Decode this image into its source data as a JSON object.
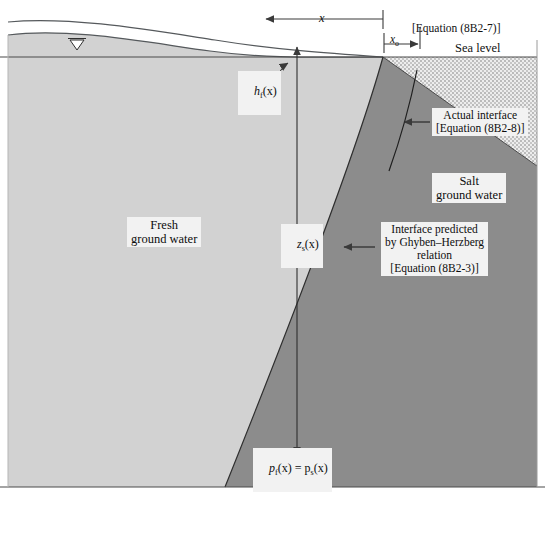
{
  "figure": {
    "type": "cross-section-diagram"
  },
  "colors": {
    "fresh_water": "#d2d2d2",
    "salt_water": "#8c8c8c",
    "unsaturated": "#ffffff",
    "sea_stipple": "#e9e9e9",
    "line": "#3a3a3a",
    "label_bg": "#f2f2f2",
    "text": "#0d0d0d"
  },
  "dimensions": {
    "x_label": "x",
    "x0_label": "x",
    "x0_subscript": "o",
    "x0_equation": "[Equation (8B2-7)]"
  },
  "labels": {
    "sea_level": "Sea level",
    "fresh_ground_water": "Fresh\nground water",
    "salt_ground_water": "Salt\nground water",
    "actual_interface": "Actual interface\n[Equation (8B2-8)]",
    "ghyben_herzberg": "Interface predicted\nby Ghyben–Herzberg\nrelation\n[Equation (8B2-3)]",
    "head_fresh": "h",
    "head_fresh_sub": "f",
    "head_fresh_arg": "(x)",
    "depth_salt": "z",
    "depth_salt_sub": "s",
    "depth_salt_arg": "(x)",
    "pressure_balance_p1": "p",
    "pressure_balance_sub1": "f",
    "pressure_balance_mid": "(x) = p",
    "pressure_balance_sub2": "s",
    "pressure_balance_end": "(x)",
    "water_table_symbol": "▽"
  },
  "equations": {
    "x0": "8B2-7",
    "actual_interface": "8B2-8",
    "ghyben_herzberg": "8B2-3"
  }
}
